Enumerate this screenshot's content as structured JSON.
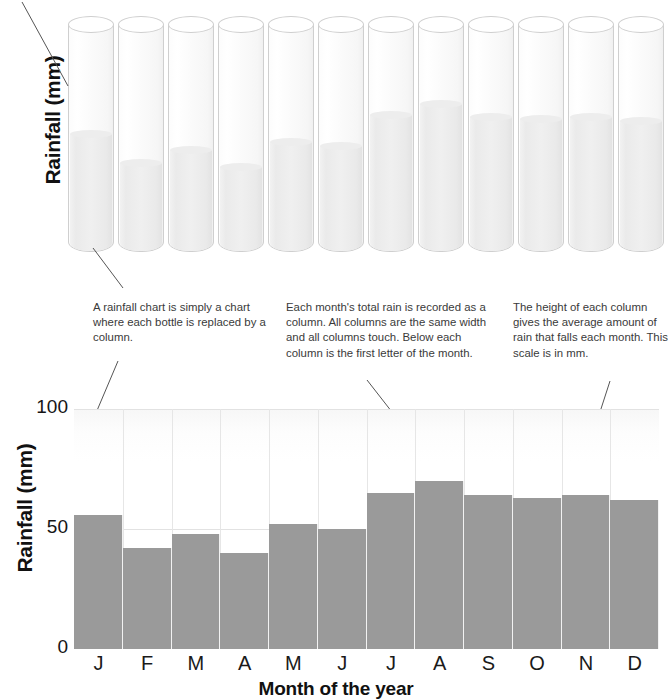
{
  "top_panel": {
    "y_axis_label": "Rainfall (mm)",
    "cut_off_text": "",
    "bottles": [
      {
        "month": "J",
        "value": 56
      },
      {
        "month": "F",
        "value": 42
      },
      {
        "month": "M",
        "value": 48
      },
      {
        "month": "A",
        "value": 40
      },
      {
        "month": "M",
        "value": 52
      },
      {
        "month": "J",
        "value": 50
      },
      {
        "month": "J",
        "value": 65
      },
      {
        "month": "A",
        "value": 70
      },
      {
        "month": "S",
        "value": 64
      },
      {
        "month": "O",
        "value": 63
      },
      {
        "month": "N",
        "value": 64
      },
      {
        "month": "D",
        "value": 62
      }
    ]
  },
  "annotations": [
    {
      "id": "annotation-left",
      "text": "A rainfall chart is simply a chart where each bottle is replaced by a column."
    },
    {
      "id": "annotation-middle",
      "text": "Each month's total rain is recorded as a column. All columns are the same width and all columns touch. Below each column is the first letter of the month."
    },
    {
      "id": "annotation-right",
      "text": "The height of each column gives the average amount of rain that falls each month. This scale is in mm."
    }
  ],
  "colors": {
    "bar_fill": "#9a9a9a",
    "gridline": "#e2e2e2",
    "glass_outline": "#cfcfcf",
    "water_fill": "#ededed",
    "leader_line": "#555555",
    "text": "#3a3a3a"
  },
  "chart_data": {
    "type": "bar",
    "title": "",
    "xlabel": "Month of the year",
    "ylabel": "Rainfall (mm)",
    "categories": [
      "J",
      "F",
      "M",
      "A",
      "M",
      "J",
      "J",
      "A",
      "S",
      "O",
      "N",
      "D"
    ],
    "month_names": [
      "January",
      "February",
      "March",
      "April",
      "May",
      "June",
      "July",
      "August",
      "September",
      "October",
      "November",
      "December"
    ],
    "values": [
      56,
      42,
      48,
      40,
      52,
      50,
      65,
      70,
      64,
      63,
      64,
      62
    ],
    "ylim": [
      0,
      100
    ],
    "yticks": [
      0,
      50,
      100
    ],
    "ytick_labels": [
      "0",
      "50",
      "100"
    ],
    "grid": true,
    "legend": "none",
    "units": "mm"
  }
}
